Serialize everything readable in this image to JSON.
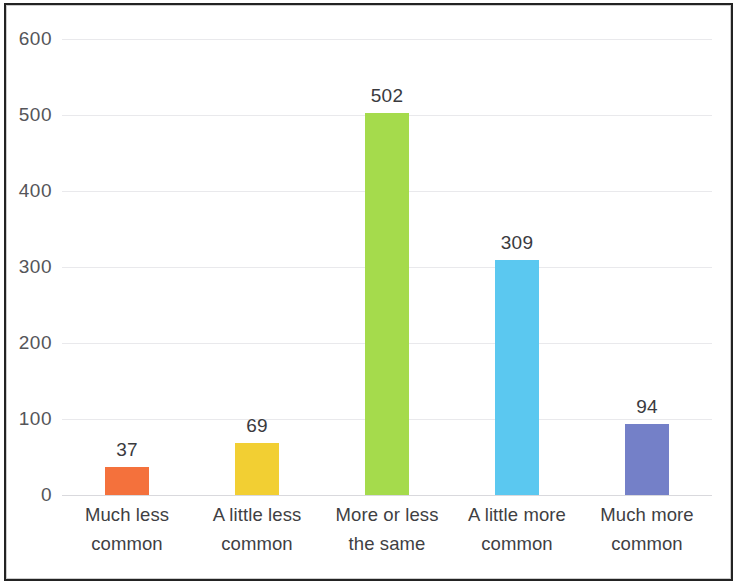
{
  "chart_data": {
    "type": "bar",
    "title": "",
    "subtitle": "",
    "xlabel": "",
    "ylabel": "",
    "categories": [
      "Much less common",
      "A little less common",
      "More or less the same",
      "A little more common",
      "Much more common"
    ],
    "category_lines": [
      [
        "Much less",
        "common"
      ],
      [
        "A little less",
        "common"
      ],
      [
        "More or less",
        "the same"
      ],
      [
        "A little more",
        "common"
      ],
      [
        "Much more",
        "common"
      ]
    ],
    "values": [
      37,
      69,
      502,
      309,
      94
    ],
    "value_labels": [
      "37",
      "69",
      "502",
      "309",
      "94"
    ],
    "colors": [
      "#f4713c",
      "#f2cf33",
      "#a5db4c",
      "#5bc8f0",
      "#7480c8"
    ],
    "ylim": [
      0,
      600
    ],
    "yticks": [
      0,
      100,
      200,
      300,
      400,
      500,
      600
    ],
    "ytick_labels": [
      "0",
      "100",
      "200",
      "300",
      "400",
      "500",
      "600"
    ],
    "grid": true,
    "grid_axis": "y",
    "legend": false,
    "legend_position": "none",
    "plot_background": "#ffffff",
    "gridline_color": "#e9e9ec",
    "axis_text_color": "#555559",
    "value_text_color": "#3a3a3e",
    "frame_color": "#232323"
  }
}
